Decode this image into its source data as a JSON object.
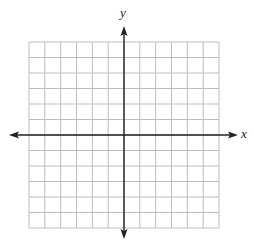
{
  "diagram": {
    "type": "coordinate-plane",
    "x_axis_label": "x",
    "y_axis_label": "y",
    "grid": {
      "columns": 12,
      "rows": 12,
      "columns_left_of_y_axis": 6,
      "columns_right_of_y_axis": 6,
      "rows_above_x_axis": 6,
      "rows_below_x_axis": 6,
      "tick_labels": false
    },
    "arrows": [
      "left",
      "right",
      "up",
      "down"
    ],
    "colors": {
      "grid_line": "#bdbdbd",
      "axis": "#222222",
      "background": "#ffffff"
    }
  }
}
